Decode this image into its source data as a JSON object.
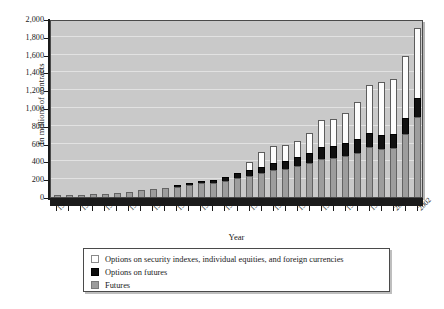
{
  "chart_data": {
    "type": "bar",
    "subtype": "stacked-bar",
    "title": "",
    "xlabel": "Year",
    "ylabel": "In millions of contracts",
    "ylim": [
      0,
      2000
    ],
    "ytick_step": 200,
    "ytick_labels": [
      "0",
      "200",
      "400",
      "600",
      "800",
      "1,000",
      "1,200",
      "1,400",
      "1,600",
      "1,800",
      "2,000"
    ],
    "grid": true,
    "legend_position": "below-plot",
    "categories": [
      1972,
      1973,
      1974,
      1975,
      1976,
      1977,
      1978,
      1979,
      1980,
      1981,
      1982,
      1983,
      1984,
      1985,
      1986,
      1987,
      1988,
      1989,
      1990,
      1991,
      1992,
      1993,
      1994,
      1995,
      1996,
      1997,
      1998,
      1999,
      2000,
      2001,
      2002
    ],
    "xtick_labels": [
      "1972",
      "1974",
      "1976",
      "1978",
      "1980",
      "1982",
      "1984",
      "1986",
      "1988",
      "1990",
      "1992",
      "1994",
      "1996",
      "1998",
      "2000",
      "2002"
    ],
    "xtick_label_every": 2,
    "series": [
      {
        "name": "Futures",
        "color": "#9d9d9d",
        "values": [
          18,
          25,
          28,
          33,
          37,
          43,
          58,
          80,
          95,
          105,
          115,
          140,
          155,
          160,
          180,
          215,
          240,
          270,
          305,
          320,
          350,
          380,
          430,
          440,
          465,
          500,
          560,
          545,
          555,
          710,
          900
        ]
      },
      {
        "name": "Options on futures",
        "color": "#111111",
        "values": [
          0,
          0,
          0,
          0,
          0,
          0,
          0,
          0,
          0,
          0,
          5,
          10,
          20,
          30,
          45,
          60,
          60,
          70,
          80,
          85,
          95,
          110,
          130,
          135,
          145,
          150,
          165,
          150,
          155,
          175,
          215
        ]
      },
      {
        "name": "Options on security indexes, individual equities, and foreign currencies",
        "color": "#fdfdfd",
        "values": [
          0,
          0,
          0,
          0,
          0,
          0,
          0,
          0,
          0,
          0,
          0,
          0,
          0,
          0,
          0,
          0,
          95,
          165,
          185,
          185,
          190,
          230,
          300,
          300,
          330,
          420,
          530,
          600,
          620,
          700,
          785
        ]
      }
    ],
    "totals": [
      18,
      25,
      28,
      33,
      37,
      43,
      58,
      80,
      95,
      105,
      120,
      150,
      175,
      190,
      225,
      275,
      395,
      505,
      570,
      590,
      635,
      720,
      860,
      875,
      940,
      1070,
      1255,
      1295,
      1330,
      1585,
      1900
    ]
  },
  "legend": {
    "items": [
      {
        "label": "Options on security indexes, individual equities, and foreign currencies",
        "swatch": "optsec"
      },
      {
        "label": "Options on futures",
        "swatch": "optfut"
      },
      {
        "label": "Futures",
        "swatch": "futures"
      }
    ]
  },
  "axes": {
    "x_title": "Year",
    "y_title": "In millions of contracts"
  },
  "colors": {
    "plot_background": "#c9c9c9",
    "gridline": "#e6e6e6",
    "axis": "#1b1b1b",
    "futures": "#9d9d9d",
    "options_on_futures": "#111111",
    "options_on_securities": "#fdfdfd"
  }
}
